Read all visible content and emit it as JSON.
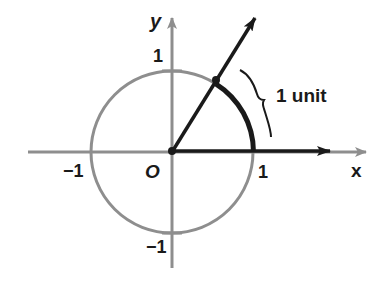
{
  "diagram": {
    "colors": {
      "axis": "#8e8e8e",
      "circle": "#8e8e8e",
      "ink": "#1a1a1a",
      "background": "#ffffff"
    },
    "labels": {
      "x_axis": "x",
      "y_axis": "y",
      "origin": "O",
      "x_pos_one": "1",
      "x_neg_one": "−1",
      "y_pos_one": "1",
      "y_neg_one": "−1",
      "arc_length": "1 unit"
    },
    "geometry": {
      "center": [
        172,
        152
      ],
      "radius": 81,
      "angle_radians": 1,
      "description": "Ray from origin at angle of 1 radian intersects unit circle; thick black arc from (1,0) to that point has length 1 unit, marked with a brace."
    }
  }
}
